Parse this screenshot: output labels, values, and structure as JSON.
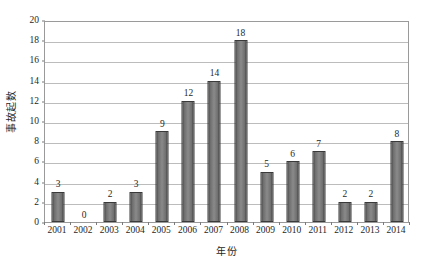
{
  "chart_data": {
    "type": "bar",
    "title": "",
    "subtitle": "",
    "xlabel": "年份",
    "ylabel": "事故起数",
    "categories": [
      "2001",
      "2002",
      "2003",
      "2004",
      "2005",
      "2006",
      "2007",
      "2008",
      "2009",
      "2010",
      "2011",
      "2012",
      "2013",
      "2014"
    ],
    "values": [
      3,
      0,
      2,
      3,
      9,
      12,
      14,
      18,
      5,
      6,
      7,
      2,
      2,
      8
    ],
    "data_labels": [
      "3",
      "0",
      "2",
      "3",
      "9",
      "12",
      "14",
      "18",
      "5",
      "6",
      "7",
      "2",
      "2",
      "8"
    ],
    "ylim": [
      0,
      20
    ],
    "ytick_step": 2,
    "ytick_labels": [
      "0",
      "2",
      "4",
      "6",
      "8",
      "10",
      "12",
      "14",
      "16",
      "18",
      "20"
    ],
    "grid": true,
    "grid_axis": "y",
    "legend": "none",
    "bar_color": "#808080",
    "bar_border_color": "#3a3a3a",
    "grid_color": "#bcbcbc",
    "axis_color": "#9a9a9a",
    "plot_background": "#ffffff"
  }
}
